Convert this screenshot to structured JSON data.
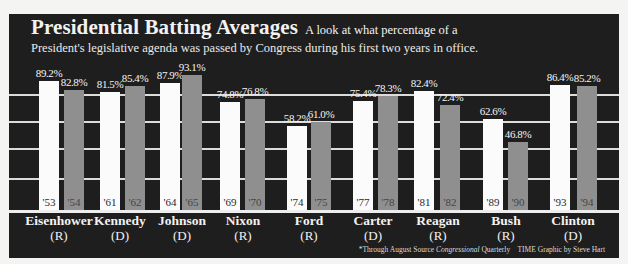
{
  "header": {
    "title": "Presidential Batting Averages",
    "subtitle_part1": "A look at what percentage of a",
    "subtitle_part2": "President's legislative agenda was passed by Congress during his first two years in office."
  },
  "footer": {
    "note": "*Through August Source",
    "source": "Congressional",
    "source_tail": "Quarterly",
    "credit": "TIME Graphic by Steve Hart"
  },
  "colors": {
    "background": "#1e1e1e",
    "first_year_bar": "#fbfbfb",
    "second_year_bar": "#8f8f8f",
    "gridline": "#dcdcdc"
  },
  "chart_data": {
    "type": "bar",
    "title": "Presidential Batting Averages",
    "subtitle": "A look at what percentage of a President's legislative agenda was passed by Congress during his first two years in office.",
    "xlabel": "",
    "ylabel": "Percent of agenda passed",
    "ylim": [
      0,
      100
    ],
    "grid": true,
    "categories": [
      "Eisenhower (R)",
      "Kennedy (D)",
      "Johnson (D)",
      "Nixon (R)",
      "Ford (R)",
      "Carter (D)",
      "Reagan (R)",
      "Bush (R)",
      "Clinton (D)"
    ],
    "series": [
      {
        "name": "First year",
        "years": [
          "'53",
          "'61",
          "'64",
          "'69",
          "'74",
          "'77",
          "'81",
          "'89",
          "'93"
        ],
        "values": [
          89.2,
          81.5,
          87.9,
          74.8,
          58.2,
          75.4,
          82.4,
          62.6,
          86.4
        ]
      },
      {
        "name": "Second year",
        "years": [
          "'54",
          "'62",
          "'65",
          "'70",
          "'75",
          "'78",
          "'82",
          "'90",
          "'94"
        ],
        "values": [
          82.8,
          85.4,
          93.1,
          76.8,
          61.0,
          78.3,
          72.4,
          46.8,
          85.2
        ]
      }
    ],
    "value_labels": {
      "first": [
        "89.2%",
        "81.5%",
        "87.9%",
        "74.8%",
        "58.2%",
        "75.4%",
        "82.4%",
        "62.6%",
        "86.4%"
      ],
      "second": [
        "82.8%",
        "85.4%",
        "93.1%",
        "76.8%",
        "61.0%",
        "78.3%",
        "72.4%",
        "46.8%",
        "85.2%"
      ]
    }
  },
  "presidents": [
    {
      "name": "Eisenhower",
      "party": "(R)"
    },
    {
      "name": "Kennedy",
      "party": "(D)"
    },
    {
      "name": "Johnson",
      "party": "(D)"
    },
    {
      "name": "Nixon",
      "party": "(R)"
    },
    {
      "name": "Ford",
      "party": "(R)"
    },
    {
      "name": "Carter",
      "party": "(D)"
    },
    {
      "name": "Reagan",
      "party": "(R)"
    },
    {
      "name": "Bush",
      "party": "(R)"
    },
    {
      "name": "Clinton",
      "party": "(D)"
    }
  ]
}
